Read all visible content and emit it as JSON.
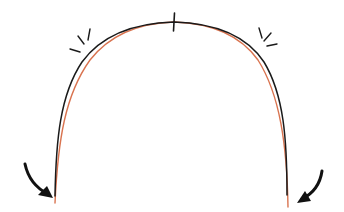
{
  "diagram": {
    "type": "arch-form-comparison",
    "colors": {
      "background": "#ffffff",
      "arch_outer": "#1a1a1a",
      "arch_inner": "#d9734f",
      "marks": "#1a1a1a"
    },
    "curves": [
      {
        "name": "outer-arch",
        "color": "#1a1a1a"
      },
      {
        "name": "inner-arch",
        "color": "#d9734f"
      }
    ],
    "annotations": {
      "midline_tick": true,
      "left_emphasis_marks": 3,
      "right_emphasis_marks": 3,
      "left_arrow": "curved arrow pointing down-right toward left end",
      "right_arrow": "curved arrow pointing down-left toward right end"
    }
  }
}
